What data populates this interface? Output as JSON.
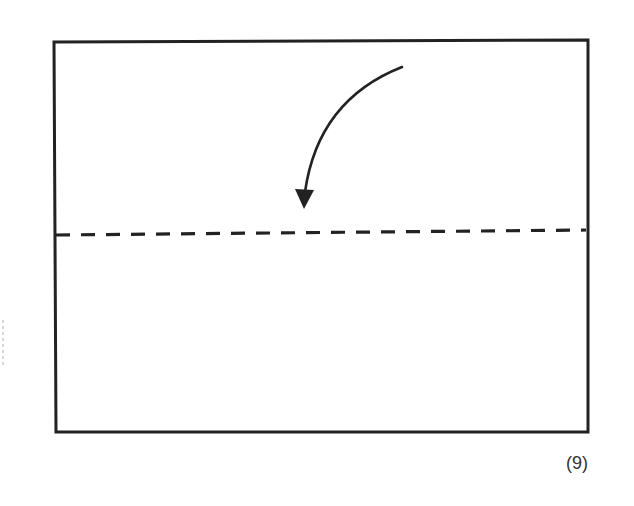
{
  "figure": {
    "step_label": "(9)",
    "colors": {
      "line": "#222222",
      "background": "#ffffff"
    },
    "elements": {
      "paper_outline": "rectangle",
      "fold_line": "dashed-valley-fold-line",
      "fold_direction": "curved-arrow-down"
    }
  }
}
